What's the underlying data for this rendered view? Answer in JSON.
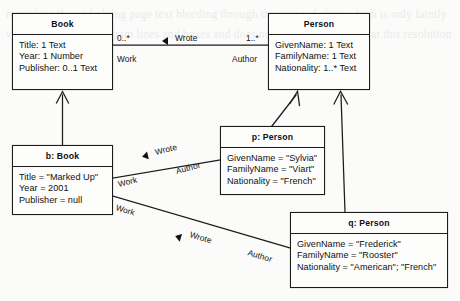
{
  "diagram": {
    "kind": "uml-class-object-diagram",
    "background_color": "#fbfbfa",
    "line_color": "#1b1b1b",
    "text_color": "#101010",
    "bleed_text": "reproduce the underlying page text bleeding through the scanned sheet which is only faintly visible behind the diagram lines and boxes and does not form legible words at this resolution"
  },
  "classes": {
    "book": {
      "name": "Book",
      "attributes": [
        "Title: 1 Text",
        "Year: 1 Number",
        "Publisher: 0..1 Text"
      ]
    },
    "person": {
      "name": "Person",
      "attributes": [
        "GivenName: 1 Text",
        "FamilyName: 1 Text",
        "Nationality: 1..* Text"
      ]
    }
  },
  "objects": {
    "b_book": {
      "name": "b: Book",
      "attributes": [
        "Title = \"Marked Up\"",
        "Year = 2001",
        "Publisher = null"
      ]
    },
    "p_person": {
      "name": "p: Person",
      "attributes": [
        "GivenName = \"Sylvia\"",
        "FamilyName = \"Viart\"",
        "Nationality = \"French\""
      ]
    },
    "q_person": {
      "name": "q: Person",
      "attributes": [
        "GivenName = \"Frederick\"",
        "FamilyName = \"Rooster\"",
        "Nationality = \"American\"; \"French\""
      ]
    }
  },
  "association": {
    "name": "Wrote",
    "source_multiplicity": "0..*",
    "source_role": "Work",
    "target_multiplicity": "1..*",
    "target_role": "Author"
  },
  "links": [
    {
      "name": "Wrote",
      "source_role": "Work",
      "target_role": "Author"
    },
    {
      "name": "Wrote",
      "source_role": "Work",
      "target_role": "Author"
    }
  ]
}
